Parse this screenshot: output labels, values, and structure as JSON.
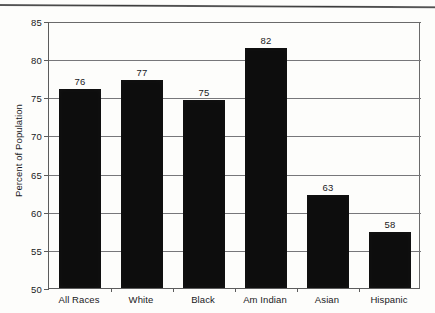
{
  "chart_data": {
    "type": "bar",
    "title": "",
    "xlabel": "",
    "ylabel": "Percent of Population",
    "categories": [
      "All Races",
      "White",
      "Black",
      "Am Indian",
      "Asian",
      "Hispanic"
    ],
    "values": [
      76,
      77,
      75,
      82,
      63,
      58
    ],
    "bar_tops": [
      76.1,
      77.3,
      74.6,
      81.5,
      62.2,
      57.4
    ],
    "data_labels": [
      "76",
      "77",
      "75",
      "82",
      "63",
      "58"
    ],
    "ylim": [
      50,
      85
    ],
    "yticks": [
      50,
      55,
      60,
      65,
      70,
      75,
      80,
      85
    ],
    "ytick_labels": [
      "50",
      "55",
      "60",
      "65",
      "70",
      "75",
      "80",
      "85"
    ],
    "grid": true,
    "legend": false,
    "legend_position": "none",
    "series": [
      {
        "name": "Percent of Population",
        "values": [
          76,
          77,
          75,
          82,
          63,
          58
        ]
      }
    ]
  },
  "colors": {
    "bar": "#0d0d0d",
    "gridline": "#77777a",
    "axis": "#5c5c5c",
    "text": "#19191b",
    "background": "#fdfdfb"
  },
  "caption": {
    "text": ""
  }
}
